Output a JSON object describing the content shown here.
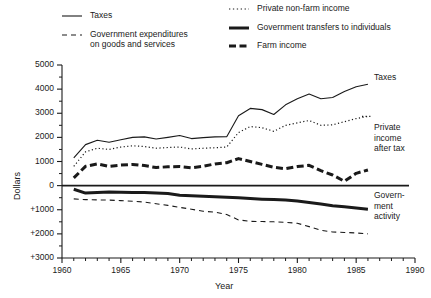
{
  "chart_data": {
    "type": "line",
    "title": "",
    "xlabel": "Year",
    "ylabel": "Dollars",
    "xlim": [
      1960,
      1990
    ],
    "ylim": [
      -3000,
      5000
    ],
    "grid": false,
    "legend_position": "top",
    "x_ticks": [
      "1960",
      "1965",
      "1970",
      "1975",
      "1980",
      "1985",
      "1990"
    ],
    "y_ticks": [
      "5000",
      "4000",
      "3000",
      "2000",
      "1000",
      "0",
      "+1000",
      "+2000",
      "+3000"
    ],
    "note_on_y_axis": "Values below the zero line are labelled +1000, +2000, +3000 (government activity magnitudes shown as positive)",
    "x": [
      1961,
      1962,
      1963,
      1964,
      1965,
      1966,
      1967,
      1968,
      1969,
      1970,
      1971,
      1972,
      1973,
      1974,
      1975,
      1976,
      1977,
      1978,
      1979,
      1980,
      1981,
      1982,
      1983,
      1984,
      1985,
      1986
    ],
    "series": [
      {
        "name": "Taxes",
        "style": "thin-solid",
        "values": [
          1150,
          1700,
          1880,
          1800,
          1900,
          2000,
          2020,
          1930,
          2000,
          2080,
          1950,
          1990,
          2020,
          2030,
          2900,
          3200,
          3150,
          2950,
          3350,
          3600,
          3800,
          3600,
          3650,
          3900,
          4100,
          4200
        ]
      },
      {
        "name": "Private non-farm income",
        "style": "dotted",
        "values": [
          800,
          1400,
          1550,
          1500,
          1600,
          1650,
          1620,
          1550,
          1580,
          1600,
          1520,
          1550,
          1570,
          1600,
          2200,
          2450,
          2400,
          2250,
          2500,
          2600,
          2700,
          2500,
          2520,
          2650,
          2780,
          2870
        ]
      },
      {
        "name": "Farm income",
        "style": "thick-dashed",
        "values": [
          320,
          800,
          900,
          800,
          850,
          880,
          830,
          750,
          780,
          790,
          740,
          800,
          900,
          950,
          1120,
          1000,
          880,
          760,
          700,
          790,
          840,
          620,
          440,
          180,
          510,
          650
        ]
      },
      {
        "name": "Government transfers to individuals",
        "style": "thick-solid",
        "values": [
          -150,
          -310,
          -280,
          -260,
          -270,
          -280,
          -290,
          -310,
          -330,
          -400,
          -420,
          -440,
          -460,
          -480,
          -500,
          -530,
          -560,
          -580,
          -600,
          -640,
          -700,
          -760,
          -830,
          -880,
          -930,
          -980
        ]
      },
      {
        "name": "Government expenditures on goods and services",
        "style": "thin-dashed",
        "values": [
          -550,
          -580,
          -590,
          -600,
          -620,
          -650,
          -680,
          -750,
          -820,
          -900,
          -980,
          -1060,
          -1100,
          -1200,
          -1420,
          -1480,
          -1490,
          -1500,
          -1520,
          -1560,
          -1700,
          -1850,
          -1920,
          -1940,
          -1960,
          -2000
        ]
      }
    ]
  },
  "legend": {
    "left": [
      {
        "label": "Taxes",
        "sub": "",
        "swatch": "thin-solid",
        "icon": "line-thin-solid-icon"
      },
      {
        "label": "Government expenditures",
        "sub": "on goods and services",
        "swatch": "thin-dashed",
        "icon": "line-thin-dashed-icon"
      }
    ],
    "right": [
      {
        "label": "Private non-farm income",
        "sub": "",
        "swatch": "dotted",
        "icon": "line-dotted-icon"
      },
      {
        "label": "Government transfers to individuals",
        "sub": "",
        "swatch": "thick-solid",
        "icon": "line-thick-solid-icon"
      },
      {
        "label": "Farm income",
        "sub": "",
        "swatch": "thick-dashed",
        "icon": "line-thick-dashed-icon"
      }
    ]
  },
  "annotations": {
    "taxes": "Taxes",
    "private_income_line1": "Private",
    "private_income_line2": "income",
    "private_income_line3": "after tax",
    "government_line1": "Govern-",
    "government_line2": "ment",
    "government_line3": "activity"
  }
}
